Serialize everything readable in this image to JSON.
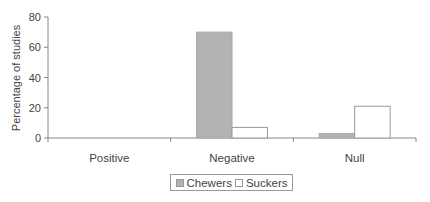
{
  "chart_data": {
    "type": "bar",
    "title": "",
    "xlabel": "",
    "ylabel": "Percentage of studies",
    "ylim": [
      0,
      80
    ],
    "yticks": [
      0,
      20,
      40,
      60,
      80
    ],
    "categories": [
      "Positive",
      "Negative",
      "Null"
    ],
    "series": [
      {
        "name": "Chewers",
        "values": [
          0,
          70,
          3
        ],
        "color": "#b3b3b3"
      },
      {
        "name": "Suckers",
        "values": [
          0,
          7,
          21
        ],
        "color": "#ffffff"
      }
    ],
    "grid": false,
    "legend_position": "bottom"
  },
  "legend": {
    "items": [
      {
        "label": "Chewers",
        "color": "#b3b3b3"
      },
      {
        "label": "Suckers",
        "color": "#ffffff"
      }
    ]
  },
  "colors": {
    "axis": "#888888",
    "bar_border": "#999999"
  }
}
